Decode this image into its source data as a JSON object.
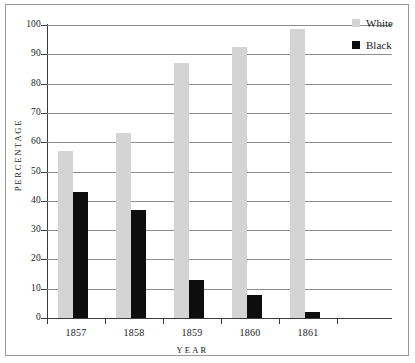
{
  "chart_data": {
    "type": "bar",
    "title": "",
    "subtitle": "",
    "xlabel": "YEAR",
    "ylabel": "PERCENTAGE",
    "categories": [
      "1857",
      "1858",
      "1859",
      "1860",
      "1861"
    ],
    "series": [
      {
        "name": "White",
        "color": "#d4d4d4",
        "values": [
          57,
          63,
          87,
          92.5,
          98.5
        ]
      },
      {
        "name": "Black",
        "color": "#0d0d0d",
        "values": [
          43,
          37,
          13,
          8,
          2
        ]
      }
    ],
    "ylim": [
      0,
      100
    ],
    "ytick_values": [
      0,
      10,
      20,
      30,
      40,
      50,
      60,
      70,
      80,
      90,
      100
    ],
    "ytick_labels": [
      "0",
      "10",
      "20",
      "30",
      "40",
      "50",
      "60",
      "70",
      "80",
      "90",
      "100"
    ],
    "grid": true,
    "grid_axis": "y",
    "legend_position": "top-right-outside",
    "legend_entries": [
      "White",
      "Black"
    ],
    "background_color": "#ffffff",
    "frame_color": "#9a9a9a",
    "axis_color": "#3a3a3a",
    "gridline_color": "#8e8e8e"
  }
}
